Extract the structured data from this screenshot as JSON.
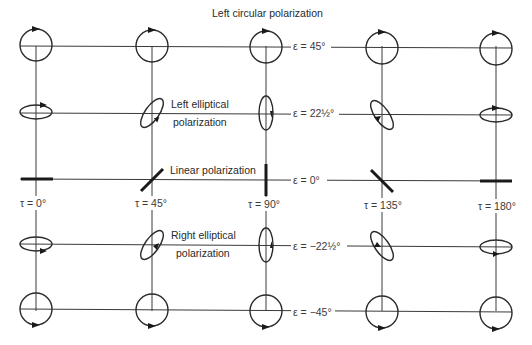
{
  "title": "Left circular polarization",
  "columns_x": [
    36,
    152,
    266,
    382,
    496
  ],
  "rows_y": [
    46,
    113,
    179,
    245,
    311
  ],
  "tau_labels": [
    "τ = 0°",
    "τ = 45°",
    "τ = 90°",
    "τ = 135°",
    "τ = 180°"
  ],
  "epsilon_labels": [
    "ε = 45°",
    "ε = 22½°",
    "ε = 0°",
    "ε = −22½°",
    "ε = −45°"
  ],
  "annotations": {
    "left_elliptical_line1": "Left elliptical",
    "left_elliptical_line2": "polarization",
    "linear": "Linear polarization",
    "right_elliptical_line1": "Right elliptical",
    "right_elliptical_line2": "polarization"
  },
  "colors": {
    "line": "#3a3a3a",
    "shape": "#2a2a2a",
    "background": "#ffffff"
  }
}
